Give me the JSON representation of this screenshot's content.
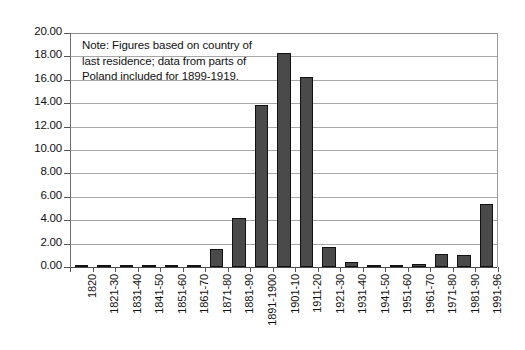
{
  "chart_data": {
    "type": "bar",
    "title": "",
    "subtitle": "",
    "xlabel": "",
    "ylabel": "",
    "ylim": [
      0.0,
      20.0
    ],
    "ytick_step": 2.0,
    "ytick_labels": [
      "20.00",
      "18.00",
      "16.00",
      "14.00",
      "12.00",
      "10.00",
      "8.00",
      "6.00",
      "4.00",
      "2.00",
      "0.00"
    ],
    "ytick_values": [
      20.0,
      18.0,
      16.0,
      14.0,
      12.0,
      10.0,
      8.0,
      6.0,
      4.0,
      2.0,
      0.0
    ],
    "grid": true,
    "grid_axis": "y",
    "legend": false,
    "legend_position": "none",
    "bar_color": "#4a4a4a",
    "bar_edge_color": "#111111",
    "plot_background": "#ffffff",
    "categories": [
      "1820",
      "1821-30",
      "1831-40",
      "1841-50",
      "1851-60",
      "1861-70",
      "1871-80",
      "1881-90",
      "1891-1900",
      "1901-10",
      "1911-20",
      "1921-30",
      "1931-40",
      "1941-50",
      "1951-60",
      "1961-70",
      "1971-80",
      "1981-90",
      "1991-96"
    ],
    "values": [
      0.15,
      0.08,
      0.08,
      0.08,
      0.08,
      0.18,
      1.5,
      4.2,
      13.85,
      18.3,
      16.25,
      1.7,
      0.4,
      0.15,
      0.1,
      0.25,
      1.1,
      1.05,
      5.35
    ],
    "annotations": [
      {
        "name": "note",
        "lines": [
          "Note: Figures based on country of",
          "last residence; data from parts of",
          "Poland included for 1899-1919."
        ]
      }
    ]
  }
}
